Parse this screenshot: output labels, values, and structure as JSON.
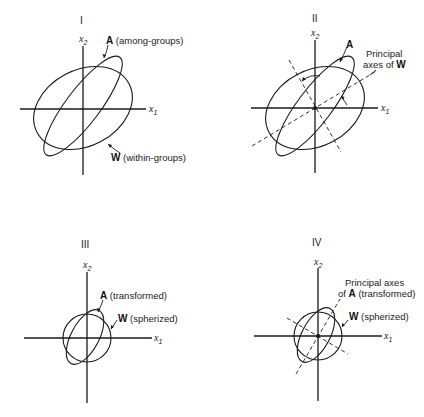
{
  "figure": {
    "panels": [
      {
        "id": "I",
        "roman": "I",
        "x_axis": {
          "var": "x",
          "sub": "1"
        },
        "y_axis": {
          "var": "x",
          "sub": "2"
        },
        "labels": [
          {
            "bold": "A",
            "text": " (among-groups)"
          },
          {
            "bold": "W",
            "text": " (within-groups)"
          }
        ]
      },
      {
        "id": "II",
        "roman": "II",
        "x_axis": {
          "var": "x",
          "sub": "1"
        },
        "y_axis": {
          "var": "x",
          "sub": "2"
        },
        "labels": [
          {
            "bold": "A",
            "text": ""
          },
          {
            "line1": "Principal",
            "line2_text": "axes of ",
            "line2_bold": "W"
          }
        ]
      },
      {
        "id": "III",
        "roman": "III",
        "x_axis": {
          "var": "x",
          "sub": "1"
        },
        "y_axis": {
          "var": "x",
          "sub": "2"
        },
        "labels": [
          {
            "bold": "A",
            "text": " (transformed)"
          },
          {
            "bold": "W",
            "text": " (spherized)"
          }
        ]
      },
      {
        "id": "IV",
        "roman": "IV",
        "x_axis": {
          "var": "x",
          "sub": "1"
        },
        "y_axis": {
          "var": "x",
          "sub": "2"
        },
        "labels": [
          {
            "line1": "Principal axes",
            "line2_text": " (transformed)",
            "line2_pre": "of ",
            "line2_bold": "A"
          },
          {
            "bold": "W",
            "text": " (spherized)"
          }
        ]
      }
    ]
  }
}
